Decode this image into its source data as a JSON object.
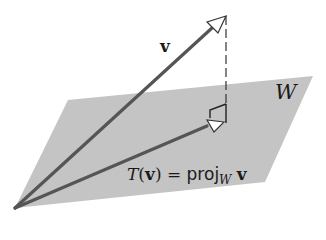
{
  "diagram": {
    "colors": {
      "plane": "#c4c4c4",
      "vector": "#555555",
      "arrowhead_fill": "#ffffff",
      "dashed": "#333333"
    },
    "labels": {
      "vector_v": "v",
      "plane_w": "W",
      "projection_T": "T",
      "projection_open": "(",
      "projection_arg": "v",
      "projection_close": ")",
      "projection_equals": " = ",
      "projection_proj": "proj",
      "projection_sub": "W",
      "projection_v": "v"
    },
    "geometry": {
      "origin": [
        15,
        208
      ],
      "v_tip": [
        226,
        16
      ],
      "proj_tip": [
        222,
        121
      ],
      "plane": [
        [
          68,
          100
        ],
        [
          313,
          76
        ],
        [
          265,
          182
        ],
        [
          15,
          208
        ]
      ]
    }
  }
}
